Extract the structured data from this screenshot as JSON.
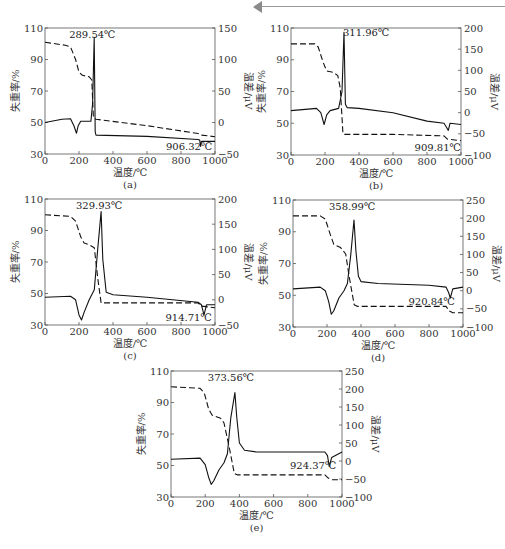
{
  "header": {
    "decoration": "page-header-arrow-rule"
  },
  "chart_data": [
    {
      "id": "a",
      "caption": "(a)",
      "type": "line",
      "xlabel": "温度/℃",
      "ylabel_left": "失重率/%",
      "ylabel_right": "温差/μV",
      "xlim": [
        0,
        1000
      ],
      "ylim_left": [
        30,
        110
      ],
      "ylim_right": [
        -50,
        150
      ],
      "xticks": [
        0,
        200,
        400,
        600,
        800,
        1000
      ],
      "yticks_left": [
        30,
        50,
        70,
        90,
        110
      ],
      "yticks_right": [
        -50,
        0,
        50,
        100,
        150
      ],
      "annotations": [
        {
          "text": "289.54℃",
          "x": 289.54
        },
        {
          "text": "906.32℃",
          "x": 906.32
        }
      ],
      "series": [
        {
          "name": "TG (失重率)",
          "axis": "left",
          "style": "dashed",
          "points": [
            [
              0,
              101
            ],
            [
              120,
              99
            ],
            [
              150,
              98
            ],
            [
              180,
              90
            ],
            [
              200,
              82
            ],
            [
              220,
              80
            ],
            [
              260,
              79
            ],
            [
              275,
              77
            ],
            [
              285,
              53
            ],
            [
              300,
              52
            ],
            [
              600,
              48
            ],
            [
              900,
              43
            ],
            [
              920,
              42
            ],
            [
              1000,
              41
            ]
          ]
        },
        {
          "name": "DTA (温差)",
          "axis": "right",
          "style": "solid",
          "points": [
            [
              0,
              0
            ],
            [
              100,
              5
            ],
            [
              150,
              6
            ],
            [
              170,
              -5
            ],
            [
              185,
              -17
            ],
            [
              195,
              -5
            ],
            [
              210,
              2
            ],
            [
              270,
              2
            ],
            [
              280,
              30
            ],
            [
              289.54,
              135
            ],
            [
              295,
              -15
            ],
            [
              300,
              -20
            ],
            [
              600,
              -22
            ],
            [
              900,
              -27
            ],
            [
              910,
              -28
            ],
            [
              915,
              -38
            ],
            [
              920,
              -30
            ],
            [
              1000,
              -30
            ]
          ]
        }
      ]
    },
    {
      "id": "b",
      "caption": "(b)",
      "type": "line",
      "xlabel": "温度/℃",
      "ylabel_left": "失重率/%",
      "ylabel_right": "温差/μV",
      "xlim": [
        0,
        1000
      ],
      "ylim_left": [
        30,
        110
      ],
      "ylim_right": [
        -100,
        200
      ],
      "xticks": [
        0,
        200,
        400,
        600,
        800,
        1000
      ],
      "yticks_left": [
        30,
        50,
        70,
        90,
        110
      ],
      "yticks_right": [
        -100,
        -50,
        0,
        50,
        100,
        150,
        200
      ],
      "annotations": [
        {
          "text": "311.96℃",
          "x": 311.96
        },
        {
          "text": "909.81℃",
          "x": 909.81
        }
      ],
      "series": [
        {
          "name": "TG (失重率)",
          "axis": "left",
          "style": "dashed",
          "points": [
            [
              0,
              100
            ],
            [
              140,
              100
            ],
            [
              160,
              98
            ],
            [
              190,
              88
            ],
            [
              210,
              83
            ],
            [
              250,
              82
            ],
            [
              275,
              80
            ],
            [
              290,
              72
            ],
            [
              305,
              44
            ],
            [
              310,
              43
            ],
            [
              600,
              43
            ],
            [
              900,
              42
            ],
            [
              920,
              40
            ],
            [
              1000,
              39
            ]
          ]
        },
        {
          "name": "DTA (温差)",
          "axis": "right",
          "style": "solid",
          "points": [
            [
              0,
              5
            ],
            [
              150,
              10
            ],
            [
              175,
              0
            ],
            [
              195,
              -28
            ],
            [
              210,
              -5
            ],
            [
              230,
              5
            ],
            [
              280,
              10
            ],
            [
              290,
              30
            ],
            [
              300,
              50
            ],
            [
              311.96,
              190
            ],
            [
              320,
              20
            ],
            [
              330,
              12
            ],
            [
              400,
              10
            ],
            [
              600,
              0
            ],
            [
              800,
              -20
            ],
            [
              900,
              -25
            ],
            [
              915,
              -35
            ],
            [
              925,
              -42
            ],
            [
              935,
              -25
            ],
            [
              1000,
              -28
            ]
          ]
        }
      ]
    },
    {
      "id": "c",
      "caption": "(c)",
      "type": "line",
      "xlabel": "温度/℃",
      "ylabel_left": "失重率/%",
      "ylabel_right": "温差/μV",
      "xlim": [
        0,
        1000
      ],
      "ylim_left": [
        30,
        110
      ],
      "ylim_right": [
        -50,
        200
      ],
      "xticks": [
        0,
        200,
        400,
        600,
        800,
        1000
      ],
      "yticks_left": [
        30,
        50,
        70,
        90,
        110
      ],
      "yticks_right": [
        -50,
        0,
        50,
        100,
        150,
        200
      ],
      "annotations": [
        {
          "text": "329.93℃",
          "x": 329.93
        },
        {
          "text": "914.71℃",
          "x": 914.71
        }
      ],
      "series": [
        {
          "name": "TG (失重率)",
          "axis": "left",
          "style": "dashed",
          "points": [
            [
              0,
              100
            ],
            [
              150,
              99
            ],
            [
              180,
              96
            ],
            [
              210,
              86
            ],
            [
              230,
              82
            ],
            [
              260,
              81
            ],
            [
              290,
              79
            ],
            [
              310,
              60
            ],
            [
              330,
              44
            ],
            [
              340,
              44
            ],
            [
              900,
              44
            ],
            [
              920,
              42
            ],
            [
              1000,
              41
            ]
          ]
        },
        {
          "name": "DTA (温差)",
          "axis": "right",
          "style": "solid",
          "points": [
            [
              0,
              5
            ],
            [
              150,
              7
            ],
            [
              180,
              0
            ],
            [
              200,
              -30
            ],
            [
              215,
              -40
            ],
            [
              230,
              -25
            ],
            [
              260,
              0
            ],
            [
              290,
              20
            ],
            [
              310,
              100
            ],
            [
              329.93,
              175
            ],
            [
              340,
              80
            ],
            [
              360,
              15
            ],
            [
              400,
              10
            ],
            [
              600,
              5
            ],
            [
              900,
              -5
            ],
            [
              920,
              -10
            ],
            [
              935,
              -30
            ],
            [
              950,
              -10
            ],
            [
              1000,
              -10
            ]
          ]
        }
      ]
    },
    {
      "id": "d",
      "caption": "(d)",
      "type": "line",
      "xlabel": "温度/℃",
      "ylabel_left": "失重率/%",
      "ylabel_right": "温差/μV",
      "xlim": [
        0,
        1000
      ],
      "ylim_left": [
        30,
        110
      ],
      "ylim_right": [
        -100,
        250
      ],
      "xticks": [
        0,
        200,
        400,
        600,
        800,
        1000
      ],
      "yticks_left": [
        30,
        50,
        70,
        90,
        110
      ],
      "yticks_right": [
        -100,
        -50,
        0,
        50,
        100,
        150,
        200,
        250
      ],
      "annotations": [
        {
          "text": "358.99℃",
          "x": 358.99
        },
        {
          "text": "920.84℃",
          "x": 920.84
        }
      ],
      "series": [
        {
          "name": "TG (失重率)",
          "axis": "left",
          "style": "dashed",
          "points": [
            [
              0,
              100
            ],
            [
              160,
              100
            ],
            [
              190,
              98
            ],
            [
              220,
              88
            ],
            [
              240,
              82
            ],
            [
              280,
              80
            ],
            [
              310,
              76
            ],
            [
              330,
              62
            ],
            [
              360,
              44
            ],
            [
              380,
              43
            ],
            [
              900,
              43
            ],
            [
              920,
              40
            ],
            [
              940,
              39
            ],
            [
              1000,
              39
            ]
          ]
        },
        {
          "name": "DTA (温差)",
          "axis": "right",
          "style": "solid",
          "points": [
            [
              0,
              5
            ],
            [
              160,
              10
            ],
            [
              190,
              0
            ],
            [
              210,
              -30
            ],
            [
              225,
              -65
            ],
            [
              240,
              -55
            ],
            [
              270,
              -20
            ],
            [
              300,
              0
            ],
            [
              320,
              20
            ],
            [
              340,
              100
            ],
            [
              358.99,
              195
            ],
            [
              370,
              110
            ],
            [
              385,
              40
            ],
            [
              400,
              25
            ],
            [
              500,
              20
            ],
            [
              800,
              15
            ],
            [
              900,
              10
            ],
            [
              915,
              -5
            ],
            [
              925,
              -20
            ],
            [
              940,
              5
            ],
            [
              1000,
              10
            ]
          ]
        }
      ]
    },
    {
      "id": "e",
      "caption": "(e)",
      "type": "line",
      "xlabel": "温度/℃",
      "ylabel_left": "失重率/%",
      "ylabel_right": "温差/μV",
      "xlim": [
        0,
        1000
      ],
      "ylim_left": [
        30,
        110
      ],
      "ylim_right": [
        -100,
        250
      ],
      "xticks": [
        0,
        200,
        400,
        600,
        800,
        1000
      ],
      "yticks_left": [
        30,
        50,
        70,
        90,
        110
      ],
      "yticks_right": [
        -100,
        -50,
        0,
        50,
        100,
        150,
        200,
        250
      ],
      "annotations": [
        {
          "text": "373.56℃",
          "x": 373.56
        },
        {
          "text": "924.37℃",
          "x": 924.37
        }
      ],
      "series": [
        {
          "name": "TG (失重率)",
          "axis": "left",
          "style": "dashed",
          "points": [
            [
              0,
              100
            ],
            [
              170,
              99
            ],
            [
              195,
              96
            ],
            [
              220,
              86
            ],
            [
              240,
              82
            ],
            [
              290,
              80
            ],
            [
              310,
              77
            ],
            [
              340,
              62
            ],
            [
              370,
              45
            ],
            [
              390,
              44
            ],
            [
              900,
              44
            ],
            [
              920,
              42
            ],
            [
              940,
              41
            ],
            [
              1000,
              41
            ]
          ]
        },
        {
          "name": "DTA (温差)",
          "axis": "right",
          "style": "solid",
          "points": [
            [
              0,
              5
            ],
            [
              170,
              8
            ],
            [
              200,
              -10
            ],
            [
              220,
              -45
            ],
            [
              235,
              -65
            ],
            [
              250,
              -55
            ],
            [
              280,
              -25
            ],
            [
              310,
              -5
            ],
            [
              330,
              20
            ],
            [
              350,
              120
            ],
            [
              373.56,
              190
            ],
            [
              385,
              120
            ],
            [
              400,
              50
            ],
            [
              430,
              30
            ],
            [
              500,
              25
            ],
            [
              900,
              25
            ],
            [
              915,
              15
            ],
            [
              925,
              -15
            ],
            [
              940,
              10
            ],
            [
              1000,
              25
            ]
          ]
        }
      ]
    }
  ]
}
